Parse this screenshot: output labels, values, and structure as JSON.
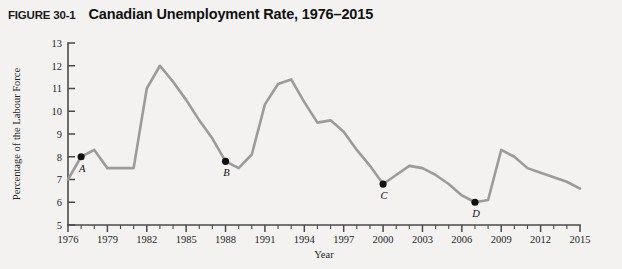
{
  "figure": {
    "number": "FIGURE 30-1",
    "title": "Canadian Unemployment Rate, 1976–2015"
  },
  "chart_data": {
    "type": "line",
    "title": "Canadian Unemployment Rate, 1976–2015",
    "xlabel": "Year",
    "ylabel": "Percentage of the Labour Force",
    "xlim": [
      1976,
      2015
    ],
    "ylim": [
      5,
      13
    ],
    "ytick_labels": [
      "5",
      "6",
      "7",
      "8",
      "9",
      "10",
      "11",
      "12",
      "13"
    ],
    "yticks": [
      5,
      6,
      7,
      8,
      9,
      10,
      11,
      12,
      13
    ],
    "xtick_labels": [
      "1976",
      "1979",
      "1982",
      "1985",
      "1988",
      "1991",
      "1994",
      "1997",
      "2000",
      "2003",
      "2006",
      "2009",
      "2012",
      "2015"
    ],
    "xticks": [
      1976,
      1979,
      1982,
      1985,
      1988,
      1991,
      1994,
      1997,
      2000,
      2003,
      2006,
      2009,
      2012,
      2015
    ],
    "xtick_minor_step": 1,
    "grid": false,
    "legend": "none",
    "line_color": "#9b9b9b",
    "marker_color": "#111111",
    "x": [
      1976,
      1977,
      1978,
      1979,
      1980,
      1981,
      1982,
      1983,
      1984,
      1985,
      1986,
      1987,
      1988,
      1989,
      1990,
      1991,
      1992,
      1993,
      1994,
      1995,
      1996,
      1997,
      1998,
      1999,
      2000,
      2001,
      2002,
      2003,
      2004,
      2005,
      2006,
      2007,
      2008,
      2009,
      2010,
      2011,
      2012,
      2013,
      2014,
      2015
    ],
    "values": [
      7.0,
      8.0,
      8.3,
      7.5,
      7.5,
      7.5,
      11.0,
      12.0,
      11.3,
      10.5,
      9.6,
      8.8,
      7.8,
      7.5,
      8.1,
      10.3,
      11.2,
      11.4,
      10.4,
      9.5,
      9.6,
      9.1,
      8.3,
      7.6,
      6.8,
      7.2,
      7.6,
      7.5,
      7.2,
      6.8,
      6.3,
      6.0,
      6.1,
      8.3,
      8.0,
      7.5,
      7.3,
      7.1,
      6.9,
      6.6
    ],
    "annotations": [
      {
        "label": "A",
        "x": 1977,
        "y": 8.0
      },
      {
        "label": "B",
        "x": 1988,
        "y": 7.8
      },
      {
        "label": "C",
        "x": 2000,
        "y": 6.8
      },
      {
        "label": "D",
        "x": 2007,
        "y": 6.0
      }
    ]
  }
}
